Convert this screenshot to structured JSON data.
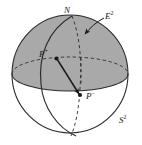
{
  "figure": {
    "caption_type": "sphere-diagram",
    "colors": {
      "upper_hemisphere_fill": "#a9a9a9",
      "lower_hemisphere_fill": "#ffffff",
      "stroke": "#2b2b2b",
      "background": "#ffffff"
    },
    "labels": {
      "north_pole": "N",
      "north_pole_sup": "",
      "plane": "E",
      "plane_sup": "2",
      "point_plus": "P",
      "point_plus_sup": "+",
      "point_minus": "P",
      "point_minus_sup": "−",
      "sphere": "S",
      "sphere_sup": "2"
    },
    "geometry": {
      "sphere_center_x": 70,
      "sphere_center_y": 74,
      "sphere_radius_x": 58,
      "sphere_radius_y": 59,
      "equator_ry": 17,
      "point_plus": [
        56,
        58
      ],
      "point_minus": [
        80,
        95
      ],
      "north_pole": [
        72,
        17
      ]
    },
    "elements": [
      "shaded-upper-hemisphere",
      "white-lower-hemisphere",
      "dashed-equator-ellipse",
      "solid-meridian-great-circle",
      "dashed-meridian-great-circle",
      "arrow-from-P-plus-to-P-minus",
      "pointer-arrow-to-equatorial-plane"
    ]
  }
}
